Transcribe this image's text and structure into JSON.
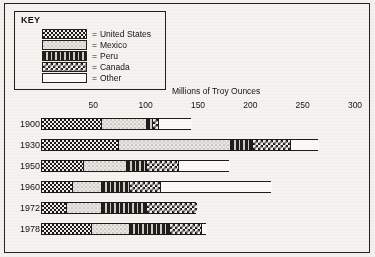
{
  "key": {
    "title": "KEY",
    "equals": "=",
    "items": [
      {
        "label": "United States",
        "pattern": "us",
        "swatch": "dark-dotted"
      },
      {
        "label": "Mexico",
        "pattern": "mx",
        "swatch": "light-speckled"
      },
      {
        "label": "Peru",
        "pattern": "pe",
        "swatch": "dark-dashed"
      },
      {
        "label": "Canada",
        "pattern": "ca",
        "swatch": "solid-black"
      },
      {
        "label": "Other",
        "pattern": "ot",
        "swatch": "checkerboard"
      }
    ]
  },
  "chart_data": {
    "type": "bar",
    "orientation": "horizontal",
    "stacked": true,
    "title": "",
    "xlabel": "Millions of Troy Ounces",
    "ylabel": "",
    "xlim": [
      0,
      300
    ],
    "xticks": [
      50,
      100,
      150,
      200,
      250,
      300
    ],
    "xticklabels": [
      "50",
      "100",
      "150",
      "200",
      "250",
      "300"
    ],
    "grid": false,
    "legend_position": "top-left",
    "categories": [
      "1900",
      "1930",
      "1950",
      "1960",
      "1972",
      "1978"
    ],
    "series": [
      {
        "name": "United States",
        "values": [
          57,
          74,
          40,
          30,
          24,
          48
        ]
      },
      {
        "name": "Mexico",
        "values": [
          43,
          107,
          41,
          27,
          33,
          36
        ]
      },
      {
        "name": "Peru",
        "values": [
          6,
          21,
          19,
          27,
          43,
          38
        ]
      },
      {
        "name": "Canada",
        "values": [
          6,
          36,
          31,
          30,
          48,
          31
        ]
      },
      {
        "name": "Other",
        "values": [
          31,
          27,
          49,
          106,
          0,
          5
        ]
      }
    ],
    "totals": [
      143,
      265,
      180,
      220,
      148,
      158
    ]
  },
  "colors": {
    "ink": "#1d1a17",
    "paper": "#f2f1ee",
    "bar_fill_blank": "#fbfaf8"
  }
}
